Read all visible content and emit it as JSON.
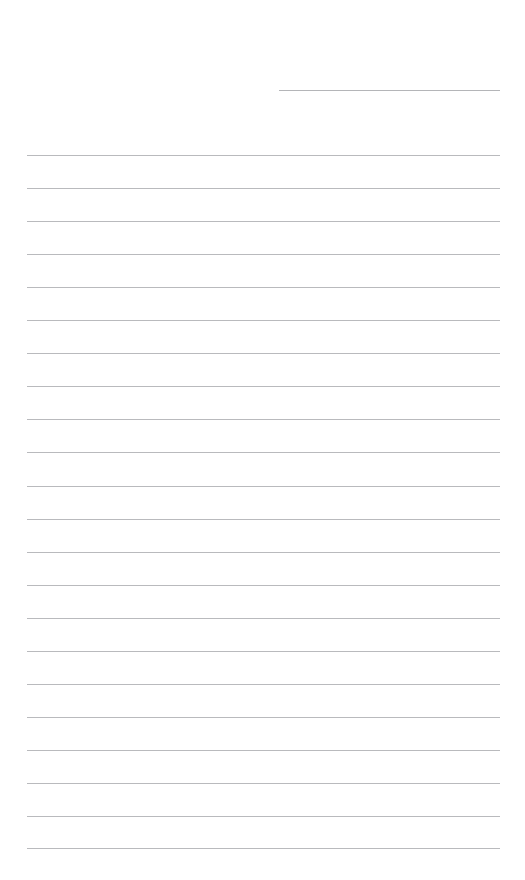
{
  "page": {
    "name": "blank-lined-writing-page",
    "width": 525,
    "height": 880,
    "background_color": "#ffffff",
    "text_content": "",
    "header_text": "",
    "footer_text": ""
  },
  "rules": {
    "color": "#b9babd",
    "thickness_px": 1,
    "left_margin_px": 27,
    "right_margin_px": 25,
    "line_spacing_px": 33.1,
    "full_width_line_count": 22,
    "first_line_y": 155,
    "last_line_y": 848
  },
  "short_rule": {
    "label": "",
    "y": 90,
    "x_start": 279,
    "x_end": 500,
    "width_px": 221,
    "color": "#b4b5b8"
  },
  "lines": [
    {
      "index": 1,
      "y": 155,
      "x_start": 27,
      "x_end": 500,
      "text": ""
    },
    {
      "index": 2,
      "y": 188,
      "x_start": 27,
      "x_end": 500,
      "text": ""
    },
    {
      "index": 3,
      "y": 221,
      "x_start": 27,
      "x_end": 500,
      "text": ""
    },
    {
      "index": 4,
      "y": 254,
      "x_start": 27,
      "x_end": 500,
      "text": ""
    },
    {
      "index": 5,
      "y": 287,
      "x_start": 27,
      "x_end": 500,
      "text": ""
    },
    {
      "index": 6,
      "y": 320,
      "x_start": 27,
      "x_end": 500,
      "text": ""
    },
    {
      "index": 7,
      "y": 353,
      "x_start": 27,
      "x_end": 500,
      "text": ""
    },
    {
      "index": 8,
      "y": 386,
      "x_start": 27,
      "x_end": 500,
      "text": ""
    },
    {
      "index": 9,
      "y": 419,
      "x_start": 27,
      "x_end": 500,
      "text": ""
    },
    {
      "index": 10,
      "y": 452,
      "x_start": 27,
      "x_end": 500,
      "text": ""
    },
    {
      "index": 11,
      "y": 486,
      "x_start": 27,
      "x_end": 500,
      "text": ""
    },
    {
      "index": 12,
      "y": 519,
      "x_start": 27,
      "x_end": 500,
      "text": ""
    },
    {
      "index": 13,
      "y": 552,
      "x_start": 27,
      "x_end": 500,
      "text": ""
    },
    {
      "index": 14,
      "y": 585,
      "x_start": 27,
      "x_end": 500,
      "text": ""
    },
    {
      "index": 15,
      "y": 618,
      "x_start": 27,
      "x_end": 500,
      "text": ""
    },
    {
      "index": 16,
      "y": 651,
      "x_start": 27,
      "x_end": 500,
      "text": ""
    },
    {
      "index": 17,
      "y": 684,
      "x_start": 27,
      "x_end": 500,
      "text": ""
    },
    {
      "index": 18,
      "y": 717,
      "x_start": 27,
      "x_end": 500,
      "text": ""
    },
    {
      "index": 19,
      "y": 750,
      "x_start": 27,
      "x_end": 500,
      "text": ""
    },
    {
      "index": 20,
      "y": 783,
      "x_start": 27,
      "x_end": 500,
      "text": ""
    },
    {
      "index": 21,
      "y": 816,
      "x_start": 27,
      "x_end": 500,
      "text": ""
    },
    {
      "index": 22,
      "y": 848,
      "x_start": 27,
      "x_end": 500,
      "text": ""
    }
  ]
}
